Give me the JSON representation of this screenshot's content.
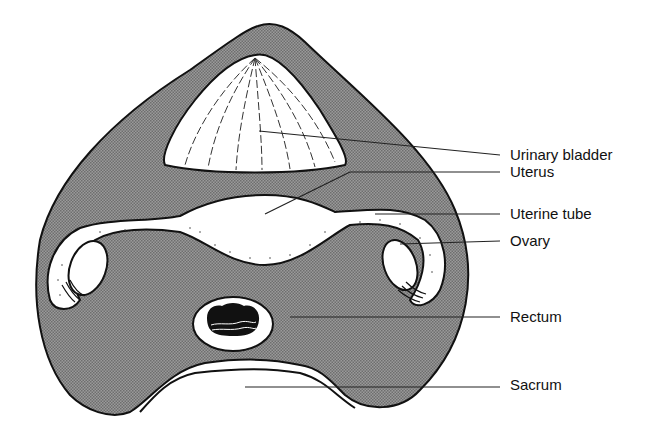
{
  "diagram": {
    "colors": {
      "tissue_fill": "#8a8a8a",
      "organ_fill": "#ffffff",
      "outline": "#111111",
      "leader_line": "#222222"
    },
    "labels": [
      {
        "id": "urinary-bladder",
        "text": "Urinary bladder",
        "x": 510,
        "y": 146
      },
      {
        "id": "uterus",
        "text": "Uterus",
        "x": 510,
        "y": 172
      },
      {
        "id": "uterine-tube",
        "text": "Uterine tube",
        "x": 510,
        "y": 213
      },
      {
        "id": "ovary",
        "text": "Ovary",
        "x": 510,
        "y": 240
      },
      {
        "id": "rectum",
        "text": "Rectum",
        "x": 510,
        "y": 316
      },
      {
        "id": "sacrum",
        "text": "Sacrum",
        "x": 510,
        "y": 383
      }
    ]
  }
}
